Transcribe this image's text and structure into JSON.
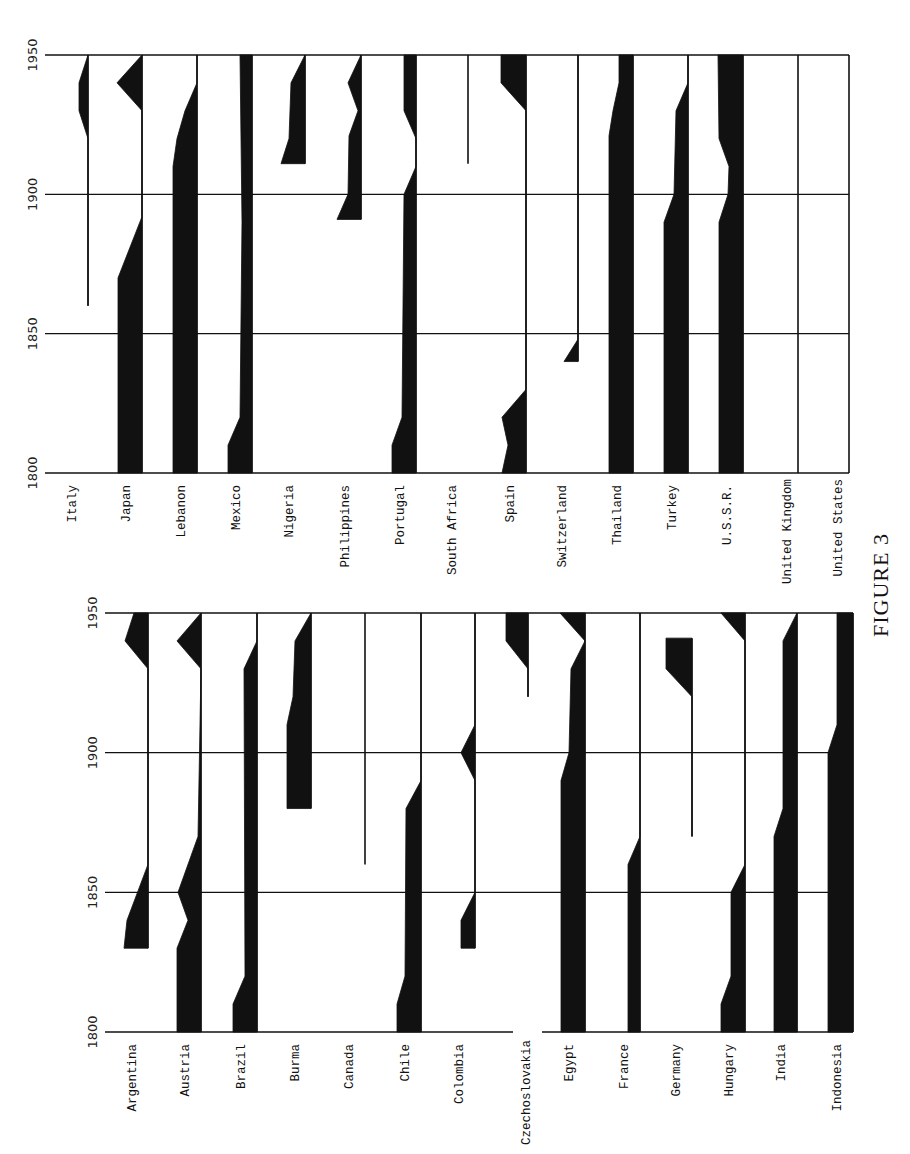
{
  "figure_label": "FIGURE 3",
  "colors": {
    "ink": "#111111",
    "paper": "#ffffff"
  },
  "chart_data": [
    {
      "type": "area",
      "orientation": "rotated-90",
      "title": "",
      "xlabel": "Year",
      "ylabel": "",
      "year_ticks": [
        "1800",
        "1850",
        "1900",
        "1950"
      ],
      "xlim": [
        1800,
        1950
      ],
      "grid": true,
      "layout": {
        "year1950_y": 55,
        "year1800_y": 473,
        "left_x": 45,
        "right_x": 849,
        "label_y": 485
      },
      "series": [
        {
          "name": "Italy",
          "baseline_x": 88,
          "points": [
            [
              1860,
              0
            ],
            [
              1920,
              0
            ],
            [
              1930,
              9
            ],
            [
              1940,
              9
            ],
            [
              1950,
              0
            ]
          ]
        },
        {
          "name": "Japan",
          "baseline_x": 142,
          "points": [
            [
              1800,
              24
            ],
            [
              1870,
              24
            ],
            [
              1892,
              0
            ],
            [
              1930,
              0
            ],
            [
              1940,
              25
            ],
            [
              1950,
              0
            ]
          ]
        },
        {
          "name": "Lebanon",
          "baseline_x": 197,
          "points": [
            [
              1800,
              24
            ],
            [
              1910,
              24
            ],
            [
              1920,
              20
            ],
            [
              1930,
              12
            ],
            [
              1940,
              0
            ],
            [
              1950,
              0
            ]
          ]
        },
        {
          "name": "Mexico",
          "baseline_x": 252,
          "points": [
            [
              1800,
              24
            ],
            [
              1810,
              24
            ],
            [
              1820,
              12
            ],
            [
              1890,
              10
            ],
            [
              1950,
              12
            ]
          ]
        },
        {
          "name": "Nigeria",
          "baseline_x": 305,
          "points": [
            [
              1911,
              24
            ],
            [
              1920,
              16
            ],
            [
              1940,
              14
            ],
            [
              1950,
              0
            ]
          ]
        },
        {
          "name": "Philippines",
          "baseline_x": 361,
          "points": [
            [
              1891,
              24
            ],
            [
              1900,
              13
            ],
            [
              1921,
              12
            ],
            [
              1930,
              3
            ],
            [
              1940,
              13
            ],
            [
              1950,
              0
            ]
          ]
        },
        {
          "name": "Portugal",
          "baseline_x": 416,
          "points": [
            [
              1800,
              24
            ],
            [
              1810,
              24
            ],
            [
              1820,
              14
            ],
            [
              1900,
              12
            ],
            [
              1910,
              0
            ],
            [
              1920,
              0
            ],
            [
              1930,
              12
            ],
            [
              1950,
              12
            ]
          ]
        },
        {
          "name": "South Africa",
          "baseline_x": 468,
          "points": [
            [
              1911,
              0
            ],
            [
              1950,
              0
            ]
          ]
        },
        {
          "name": "Spain",
          "baseline_x": 526,
          "points": [
            [
              1800,
              24
            ],
            [
              1810,
              18
            ],
            [
              1820,
              24
            ],
            [
              1830,
              0
            ],
            [
              1930,
              0
            ],
            [
              1940,
              25
            ],
            [
              1950,
              25
            ]
          ]
        },
        {
          "name": "Switzerland",
          "baseline_x": 578,
          "points": [
            [
              1840,
              14
            ],
            [
              1848,
              0
            ],
            [
              1950,
              0
            ]
          ]
        },
        {
          "name": "Thailand",
          "baseline_x": 633,
          "points": [
            [
              1800,
              24
            ],
            [
              1921,
              24
            ],
            [
              1930,
              20
            ],
            [
              1940,
              14
            ],
            [
              1950,
              14
            ]
          ]
        },
        {
          "name": "Turkey",
          "baseline_x": 688,
          "points": [
            [
              1800,
              24
            ],
            [
              1890,
              24
            ],
            [
              1900,
              14
            ],
            [
              1930,
              12
            ],
            [
              1940,
              0
            ],
            [
              1950,
              0
            ]
          ]
        },
        {
          "name": "U.S.S.R.",
          "baseline_x": 743,
          "points": [
            [
              1800,
              24
            ],
            [
              1890,
              24
            ],
            [
              1900,
              15
            ],
            [
              1910,
              14
            ],
            [
              1920,
              24
            ],
            [
              1950,
              25
            ]
          ]
        },
        {
          "name": "United Kingdom",
          "baseline_x": 798,
          "points": [
            [
              1800,
              0
            ],
            [
              1950,
              0
            ]
          ]
        },
        {
          "name": "United States",
          "baseline_x": 849,
          "points": [
            [
              1800,
              0
            ],
            [
              1950,
              0
            ]
          ]
        }
      ]
    },
    {
      "type": "area",
      "orientation": "rotated-90",
      "title": "",
      "xlabel": "Year",
      "ylabel": "",
      "year_ticks": [
        "1800",
        "1850",
        "1900",
        "1950"
      ],
      "xlim": [
        1800,
        1950
      ],
      "grid": true,
      "layout": {
        "year1950_y": 613,
        "year1800_y": 1032,
        "left_x": 105,
        "right_x": 853,
        "label_y": 1044
      },
      "series": [
        {
          "name": "Argentina",
          "baseline_x": 148,
          "points": [
            [
              1830,
              24
            ],
            [
              1840,
              21
            ],
            [
              1860,
              0
            ],
            [
              1930,
              0
            ],
            [
              1940,
              23
            ],
            [
              1950,
              14
            ]
          ]
        },
        {
          "name": "Austria",
          "baseline_x": 201,
          "points": [
            [
              1800,
              24
            ],
            [
              1830,
              24
            ],
            [
              1840,
              13
            ],
            [
              1850,
              23
            ],
            [
              1870,
              3
            ],
            [
              1930,
              0
            ],
            [
              1940,
              24
            ],
            [
              1950,
              0
            ]
          ]
        },
        {
          "name": "Brazil",
          "baseline_x": 257,
          "points": [
            [
              1800,
              24
            ],
            [
              1810,
              24
            ],
            [
              1820,
              12
            ],
            [
              1930,
              13
            ],
            [
              1940,
              0
            ],
            [
              1950,
              0
            ]
          ]
        },
        {
          "name": "Burma",
          "baseline_x": 311,
          "points": [
            [
              1880,
              24
            ],
            [
              1910,
              24
            ],
            [
              1920,
              18
            ],
            [
              1940,
              16
            ],
            [
              1950,
              0
            ]
          ]
        },
        {
          "name": "Canada",
          "baseline_x": 365,
          "points": [
            [
              1860,
              0
            ],
            [
              1950,
              0
            ]
          ]
        },
        {
          "name": "Chile",
          "baseline_x": 421,
          "points": [
            [
              1800,
              24
            ],
            [
              1810,
              24
            ],
            [
              1820,
              16
            ],
            [
              1880,
              15
            ],
            [
              1890,
              0
            ],
            [
              1950,
              0
            ]
          ]
        },
        {
          "name": "Colombia",
          "baseline_x": 475,
          "points": [
            [
              1830,
              14
            ],
            [
              1840,
              14
            ],
            [
              1850,
              0
            ],
            [
              1890,
              0
            ],
            [
              1900,
              14
            ],
            [
              1910,
              0
            ],
            [
              1950,
              0
            ]
          ]
        },
        {
          "name": "Czechoslovakia",
          "baseline_x": 528,
          "points": [
            [
              1920,
              0
            ],
            [
              1930,
              0
            ],
            [
              1940,
              22
            ],
            [
              1950,
              22
            ]
          ]
        },
        {
          "name": "Egypt",
          "baseline_x": 585,
          "points": [
            [
              1800,
              24
            ],
            [
              1890,
              24
            ],
            [
              1900,
              16
            ],
            [
              1930,
              14
            ],
            [
              1940,
              0
            ],
            [
              1950,
              25
            ]
          ]
        },
        {
          "name": "France",
          "baseline_x": 640,
          "points": [
            [
              1800,
              12
            ],
            [
              1860,
              12
            ],
            [
              1870,
              0
            ],
            [
              1950,
              0
            ]
          ]
        },
        {
          "name": "Germany",
          "baseline_x": 692,
          "points": [
            [
              1870,
              0
            ],
            [
              1920,
              0
            ],
            [
              1930,
              26
            ],
            [
              1941,
              26
            ]
          ]
        },
        {
          "name": "Hungary",
          "baseline_x": 745,
          "points": [
            [
              1800,
              24
            ],
            [
              1810,
              24
            ],
            [
              1820,
              14
            ],
            [
              1850,
              14
            ],
            [
              1860,
              0
            ],
            [
              1940,
              0
            ],
            [
              1950,
              24
            ]
          ]
        },
        {
          "name": "India",
          "baseline_x": 797,
          "points": [
            [
              1800,
              23
            ],
            [
              1870,
              23
            ],
            [
              1880,
              14
            ],
            [
              1940,
              14
            ],
            [
              1950,
              0
            ]
          ]
        },
        {
          "name": "Indonesia",
          "baseline_x": 853,
          "points": [
            [
              1800,
              25
            ],
            [
              1900,
              25
            ],
            [
              1910,
              16
            ],
            [
              1950,
              16
            ]
          ]
        }
      ]
    }
  ]
}
